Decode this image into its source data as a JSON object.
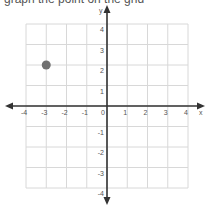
{
  "header": {
    "clipped_text": "graph the point on the grid"
  },
  "chart_data": {
    "type": "scatter",
    "title": "",
    "xlabel": "x",
    "ylabel": "y",
    "xlim": [
      -4,
      4
    ],
    "ylim": [
      -4,
      4
    ],
    "grid": true,
    "x_ticks": [
      "-4",
      "-3",
      "-2",
      "-1",
      "0",
      "1",
      "2",
      "3",
      "4"
    ],
    "y_ticks": [
      "4",
      "3",
      "2",
      "1",
      "-1",
      "-2",
      "-3",
      "-4"
    ],
    "points": [
      {
        "x": -3,
        "y": 2,
        "color": "#707070"
      }
    ]
  },
  "colors": {
    "grid": "#d8d8d8",
    "axis": "#333333",
    "point": "#707070"
  }
}
